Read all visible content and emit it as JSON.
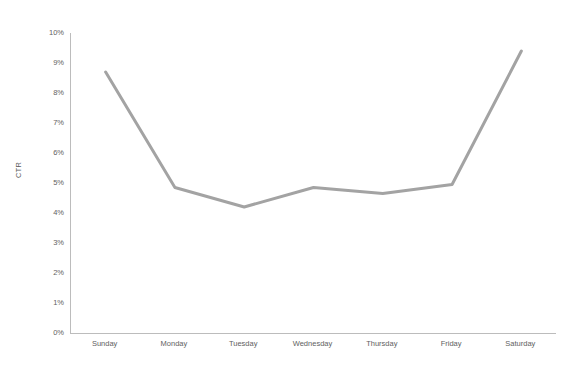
{
  "chart_data": {
    "type": "line",
    "title": "",
    "xlabel": "",
    "ylabel": "CTR",
    "categories": [
      "Sunday",
      "Monday",
      "Tuesday",
      "Wednesday",
      "Thursday",
      "Friday",
      "Saturday"
    ],
    "values": [
      8.7,
      4.85,
      4.2,
      4.85,
      4.65,
      4.95,
      9.4
    ],
    "series": [
      {
        "name": "CTR",
        "values": [
          8.7,
          4.85,
          4.2,
          4.85,
          4.65,
          4.95,
          9.4
        ],
        "color": "#a3a3a3"
      }
    ],
    "ylim": [
      0,
      10
    ],
    "ytick_values": [
      0,
      1,
      2,
      3,
      4,
      5,
      6,
      7,
      8,
      9,
      10
    ],
    "ytick_labels": [
      "0%",
      "1%",
      "2%",
      "3%",
      "4%",
      "5%",
      "6%",
      "7%",
      "8%",
      "9%",
      "10%"
    ],
    "value_suffix": "%",
    "grid": false,
    "legend": false,
    "legend_position": "none",
    "line_color": "#a3a3a3",
    "line_width": 3,
    "axis_color": "#bcbcbc",
    "tick_label_color": "#616161",
    "background_color": "#ffffff"
  }
}
